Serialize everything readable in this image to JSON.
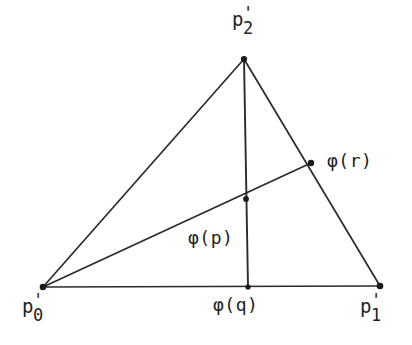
{
  "figure": {
    "type": "geometric-diagram",
    "background_color": "#ffffff",
    "line_color": "#2b2b2b",
    "text_color": "#232323"
  },
  "points": {
    "p0": {
      "label_base": "p",
      "prime": "'",
      "subscript": "0",
      "x": 43,
      "y": 287
    },
    "p1": {
      "label_base": "p",
      "prime": "'",
      "subscript": "1",
      "x": 380,
      "y": 286
    },
    "p2": {
      "label_base": "p",
      "prime": "'",
      "subscript": "2",
      "x": 244,
      "y": 59
    },
    "phi_q": {
      "label": "φ(q)",
      "x": 248,
      "y": 287
    },
    "phi_p": {
      "label": "φ(p)",
      "x": 246,
      "y": 199
    },
    "phi_r": {
      "label": "φ(r)",
      "x": 311,
      "y": 163
    }
  },
  "segments": [
    {
      "name": "edge-p0-p2",
      "from": "p0",
      "to": "p2"
    },
    {
      "name": "edge-p2-p1",
      "from": "p2",
      "to": "p1"
    },
    {
      "name": "edge-p0-p1",
      "from": "p0",
      "to": "p1"
    },
    {
      "name": "cevian-p2-phiq",
      "from": "p2",
      "to": "phi_q"
    },
    {
      "name": "ray-p0-phir",
      "from": "p0",
      "to": "phi_r"
    }
  ]
}
